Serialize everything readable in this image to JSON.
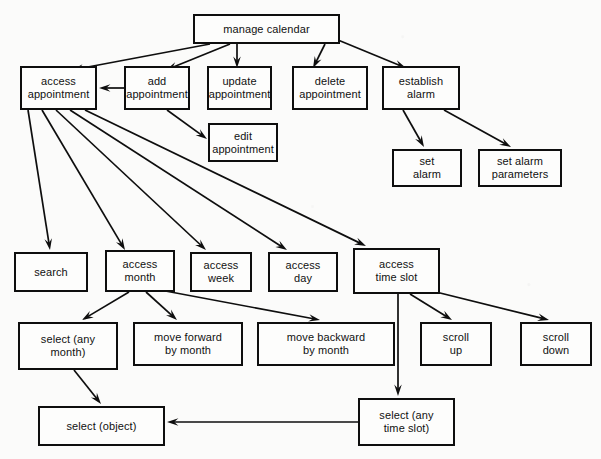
{
  "diagram": {
    "title": "manage calendar",
    "type": "hierarchical task analysis / function decomposition diagram",
    "style": {
      "background": "#fbfbfa",
      "box_fill": "#fdfdfc",
      "box_stroke": "#0e0e0e",
      "edge_color": "#0e0e0e",
      "text_color": "#111111"
    },
    "nodes": [
      {
        "id": "manage_calendar",
        "label": "manage calendar",
        "x": 193,
        "y": 14,
        "w": 147,
        "h": 30
      },
      {
        "id": "access_appointment",
        "label": "access\nappointment",
        "x": 20,
        "y": 66,
        "w": 77,
        "h": 44
      },
      {
        "id": "add_appointment",
        "label": "add\nappointment",
        "x": 124,
        "y": 66,
        "w": 66,
        "h": 44
      },
      {
        "id": "update_appointment",
        "label": "update\nappointment",
        "x": 207,
        "y": 66,
        "w": 65,
        "h": 44
      },
      {
        "id": "delete_appointment",
        "label": "delete\nappointment",
        "x": 292,
        "y": 66,
        "w": 76,
        "h": 44
      },
      {
        "id": "establish_alarm",
        "label": "establish\nalarm",
        "x": 382,
        "y": 66,
        "w": 78,
        "h": 44
      },
      {
        "id": "edit_appointment",
        "label": "edit\nappointment",
        "x": 208,
        "y": 123,
        "w": 70,
        "h": 39
      },
      {
        "id": "set_alarm",
        "label": "set\nalarm",
        "x": 392,
        "y": 149,
        "w": 70,
        "h": 38
      },
      {
        "id": "set_alarm_parameters",
        "label": "set alarm\nparameters",
        "x": 478,
        "y": 149,
        "w": 84,
        "h": 38
      },
      {
        "id": "search",
        "label": "search",
        "x": 14,
        "y": 252,
        "w": 74,
        "h": 40
      },
      {
        "id": "access_month",
        "label": "access\nmonth",
        "x": 105,
        "y": 250,
        "w": 70,
        "h": 42
      },
      {
        "id": "access_week",
        "label": "access\nweek",
        "x": 190,
        "y": 252,
        "w": 62,
        "h": 40
      },
      {
        "id": "access_day",
        "label": "access\nday",
        "x": 268,
        "y": 252,
        "w": 70,
        "h": 40
      },
      {
        "id": "access_time_slot",
        "label": "access\ntime slot",
        "x": 353,
        "y": 248,
        "w": 87,
        "h": 46
      },
      {
        "id": "select_any_month",
        "label": "select (any\nmonth)",
        "x": 18,
        "y": 322,
        "w": 100,
        "h": 48
      },
      {
        "id": "move_forward",
        "label": "move forward\nby month",
        "x": 133,
        "y": 322,
        "w": 110,
        "h": 44
      },
      {
        "id": "move_backward",
        "label": "move backward\nby month",
        "x": 257,
        "y": 322,
        "w": 138,
        "h": 44
      },
      {
        "id": "scroll_up",
        "label": "scroll\nup",
        "x": 420,
        "y": 322,
        "w": 72,
        "h": 44
      },
      {
        "id": "scroll_down",
        "label": "scroll\ndown",
        "x": 520,
        "y": 322,
        "w": 72,
        "h": 44
      },
      {
        "id": "select_object",
        "label": "select (object)",
        "x": 38,
        "y": 406,
        "w": 127,
        "h": 40
      },
      {
        "id": "select_any_time_slot",
        "label": "select (any\ntime slot)",
        "x": 358,
        "y": 398,
        "w": 97,
        "h": 48
      }
    ],
    "edges": [
      {
        "from": "manage_calendar",
        "to": "access_appointment",
        "points": "210,44 72,70"
      },
      {
        "from": "manage_calendar",
        "to": "add_appointment",
        "points": "230,44 166,70"
      },
      {
        "from": "manage_calendar",
        "to": "update_appointment",
        "points": "237,44 237,68"
      },
      {
        "from": "manage_calendar",
        "to": "delete_appointment",
        "points": "325,44 313,68"
      },
      {
        "from": "manage_calendar",
        "to": "establish_alarm",
        "points": "338,40 406,68"
      },
      {
        "from": "add_appointment",
        "to": "access_appointment",
        "points": "124,88 99,88"
      },
      {
        "from": "add_appointment",
        "to": "edit_appointment",
        "points": "167,110 207,139"
      },
      {
        "from": "establish_alarm",
        "to": "set_alarm",
        "points": "403,110 424,147"
      },
      {
        "from": "establish_alarm",
        "to": "set_alarm_parameters",
        "points": "444,110 511,147"
      },
      {
        "from": "access_appointment",
        "to": "search",
        "points": "28,110 50,250"
      },
      {
        "from": "access_appointment",
        "to": "access_month",
        "points": "42,110 125,250"
      },
      {
        "from": "access_appointment",
        "to": "access_week",
        "points": "56,110 206,250"
      },
      {
        "from": "access_appointment",
        "to": "access_day",
        "points": "70,110 287,250"
      },
      {
        "from": "access_appointment",
        "to": "access_time_slot",
        "points": "85,110 366,246"
      },
      {
        "from": "access_month",
        "to": "select_any_month",
        "points": "129,292 82,320"
      },
      {
        "from": "access_month",
        "to": "move_forward",
        "points": "146,292 177,320"
      },
      {
        "from": "access_month",
        "to": "move_backward",
        "points": "160,290 320,320"
      },
      {
        "from": "access_time_slot",
        "to": "scroll_up",
        "points": "410,294 452,320"
      },
      {
        "from": "access_time_slot",
        "to": "scroll_down",
        "points": "428,290 549,320"
      },
      {
        "from": "access_time_slot",
        "to": "select_any_time_slot",
        "points": "398,294 398,396"
      },
      {
        "from": "select_any_month",
        "to": "select_object",
        "points": "74,370 101,404"
      },
      {
        "from": "select_any_time_slot",
        "to": "select_object",
        "points": "358,422 167,422"
      }
    ]
  }
}
